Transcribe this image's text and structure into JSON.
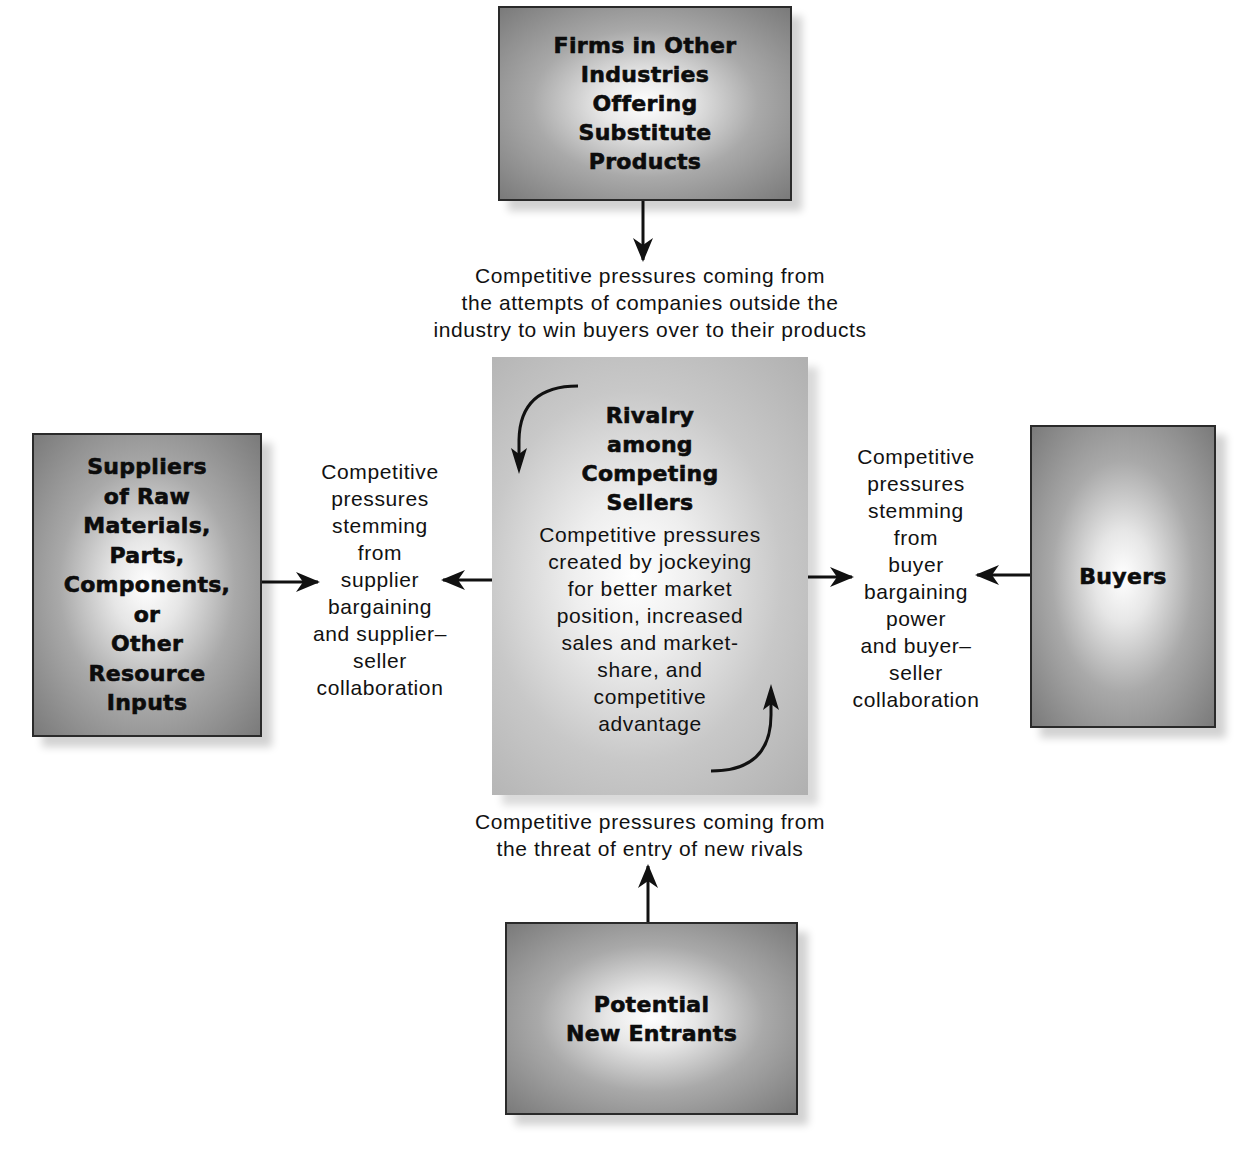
{
  "diagram": {
    "type": "five-forces",
    "boxes": {
      "substitutes": {
        "title": "Firms in Other Industries Offering Substitute Products",
        "lines": [
          "Firms in Other",
          "Industries",
          "Offering",
          "Substitute",
          "Products"
        ]
      },
      "suppliers": {
        "title": "Suppliers of Raw Materials, Parts, Components, or Other Resource Inputs",
        "lines": [
          "Suppliers",
          "of Raw",
          "Materials,",
          "Parts,",
          "Components,",
          "or",
          "Other",
          "Resource",
          "Inputs"
        ]
      },
      "rivalry": {
        "title_lines": [
          "Rivalry",
          "among",
          "Competing",
          "Sellers"
        ],
        "desc_lines": [
          "Competitive pressures",
          "created by jockeying",
          "for better market",
          "position, increased",
          "sales and market-",
          "share, and",
          "competitive",
          "advantage"
        ]
      },
      "buyers": {
        "title": "Buyers"
      },
      "new_entrants": {
        "lines": [
          "Potential",
          "New Entrants"
        ]
      }
    },
    "labels": {
      "substitutes": [
        "Competitive pressures coming from",
        "the attempts of companies outside the",
        "industry to win buyers over to their products"
      ],
      "suppliers": [
        "Competitive",
        "pressures",
        "stemming",
        "from",
        "supplier",
        "bargaining",
        "and supplier–",
        "seller",
        "collaboration"
      ],
      "buyers": [
        "Competitive",
        "pressures",
        "stemming",
        "from",
        "buyer",
        "bargaining",
        "power",
        "and buyer–",
        "seller",
        "collaboration"
      ],
      "new_entrants": [
        "Competitive pressures coming from",
        "the threat of entry of new rivals"
      ]
    },
    "colors": {
      "box_border": "#2a2a2a",
      "box_dark": "#7a7a7a",
      "box_light": "#ffffff",
      "arrow": "#111111",
      "background": "#ffffff"
    }
  }
}
